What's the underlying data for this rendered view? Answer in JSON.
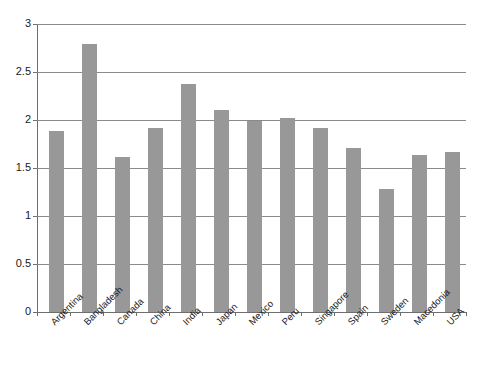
{
  "chart_data": {
    "type": "bar",
    "title": "",
    "subtitle": "",
    "xlabel": "",
    "ylabel": "",
    "ylim": [
      0,
      3
    ],
    "y_ticks": [
      "0",
      "0.5",
      "1",
      "1.5",
      "2",
      "2.5",
      "3"
    ],
    "y_tick_values": [
      0,
      0.5,
      1,
      1.5,
      2,
      2.5,
      3
    ],
    "grid": "horizontal",
    "legend": "none",
    "bar_color": "#989898",
    "axis_color": "#6e6e6e",
    "gridline_color": "#8a8a8a",
    "categories": [
      "Argentina",
      "Bangladesh",
      "Canada",
      "China",
      "India",
      "Japan",
      "Mexico",
      "Peru",
      "Singapore",
      "Spain",
      "Sweden",
      "Macedonia",
      "USA"
    ],
    "values": [
      1.89,
      2.79,
      1.61,
      1.92,
      2.37,
      2.1,
      1.99,
      2.02,
      1.92,
      1.71,
      1.28,
      1.64,
      1.67
    ]
  }
}
